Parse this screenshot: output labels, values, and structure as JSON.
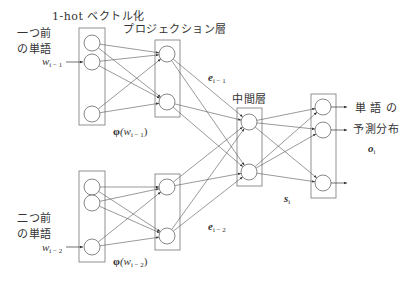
{
  "labels": {
    "onehot_title": "1-hot ベクトル化",
    "projection_title": "プロジェクション層",
    "middle_title": "中間層",
    "prev1_line1": "一つ前",
    "prev1_line2": "の単語",
    "prev2_line1": "二つ前",
    "prev2_line2": "の単語",
    "input1_var": "w",
    "input1_sub": "i − 1",
    "input2_var": "w",
    "input2_sub": "i − 2",
    "phi1_symbol": "φ",
    "phi1_arg": "(w",
    "phi1_sub": "i − 1",
    "phi1_close": ")",
    "phi2_symbol": "φ",
    "phi2_arg": "(w",
    "phi2_sub": "i − 2",
    "phi2_close": ")",
    "e1_var": "e",
    "e1_sub": "i − 1",
    "e2_var": "e",
    "e2_sub": "i − 2",
    "s_var": "s",
    "s_sub": "i",
    "output_line1": "単 語 の",
    "output_line2": "予測分布",
    "o_var": "o",
    "o_sub": "i"
  },
  "layers": {
    "input1": {
      "box": [
        79,
        28,
        26,
        97
      ],
      "nodes": [
        [
          92,
          43
        ],
        [
          92,
          62
        ],
        [
          92,
          114
        ]
      ]
    },
    "input2": {
      "box": [
        79,
        171,
        26,
        91
      ],
      "nodes": [
        [
          92,
          187
        ],
        [
          92,
          203
        ],
        [
          92,
          247
        ]
      ]
    },
    "proj1": {
      "box": [
        155,
        40,
        25,
        77
      ],
      "nodes": [
        [
          167,
          54
        ],
        [
          167,
          102
        ]
      ]
    },
    "proj2": {
      "box": [
        155,
        174,
        25,
        76
      ],
      "nodes": [
        [
          167,
          187
        ],
        [
          167,
          236
        ]
      ]
    },
    "middle": {
      "box": [
        237,
        108,
        25,
        78
      ],
      "nodes": [
        [
          249,
          122
        ],
        [
          249,
          172
        ]
      ]
    },
    "output": {
      "box": [
        311,
        94,
        25,
        104
      ],
      "nodes": [
        [
          323,
          107
        ],
        [
          323,
          130
        ],
        [
          323,
          183
        ]
      ]
    }
  },
  "colors": {
    "stroke": "#555555",
    "box": "#777777",
    "text": "#333333"
  }
}
